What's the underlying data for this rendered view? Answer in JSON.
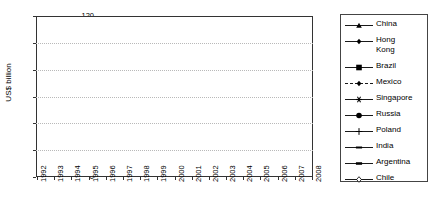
{
  "chart_data": {
    "type": "line",
    "title": "",
    "xlabel": "",
    "ylabel": "US$ billion",
    "ylim": [
      0,
      120
    ],
    "yticks": [
      0,
      20,
      40,
      60,
      80,
      100,
      120
    ],
    "grid": true,
    "legend_position": "right",
    "x": [
      1992,
      1993,
      1994,
      1995,
      1996,
      1997,
      1998,
      1999,
      2000,
      2001,
      2002,
      2003,
      2004,
      2005,
      2006,
      2007,
      2008
    ],
    "categories": [
      "1992",
      "1993",
      "1994",
      "1995",
      "1996",
      "1997",
      "1998",
      "1999",
      "2000",
      "2001",
      "2002",
      "2003",
      "2004",
      "2005",
      "2006",
      "2007",
      "2008"
    ],
    "series": [
      {
        "name": "China",
        "marker": "triangle",
        "line": "solid",
        "values": [
          11,
          27,
          34,
          36,
          40,
          44.5,
          45.5,
          40.5,
          41,
          47,
          53,
          54,
          61,
          73,
          73,
          84,
          108
        ]
      },
      {
        "name": "Hong Kong",
        "marker": "diamond",
        "line": "solid",
        "values": [
          3.9,
          3.7,
          7.8,
          6.2,
          10.5,
          11.4,
          14.8,
          24.6,
          62.5,
          23.8,
          9.7,
          13.6,
          34.3,
          34.6,
          45.7,
          55.9,
          63
        ]
      },
      {
        "name": "Brazil",
        "marker": "square",
        "line": "solid",
        "values": [
          2.1,
          1.3,
          2.2,
          4.4,
          11,
          19,
          28.9,
          28.6,
          32.8,
          22.5,
          16.6,
          10.1,
          18.1,
          15.1,
          18.8,
          34.6,
          45.1
        ]
      },
      {
        "name": "Mexico",
        "marker": "diamond",
        "line": "dashed",
        "values": [
          4.4,
          4.4,
          11,
          9.5,
          9.2,
          12.8,
          12.4,
          13.7,
          17.8,
          27.2,
          19.1,
          14.2,
          22.3,
          21.9,
          19.3,
          27.3,
          22
        ]
      },
      {
        "name": "Singapore",
        "marker": "asterisk",
        "line": "solid",
        "values": [
          2.2,
          4.7,
          8.6,
          8.8,
          9.7,
          13,
          7.3,
          16.6,
          16.5,
          15.1,
          6.4,
          11.9,
          19.8,
          15,
          24.7,
          31.6,
          22.7
        ]
      },
      {
        "name": "Russia",
        "marker": "circle",
        "line": "solid",
        "values": [
          0.7,
          1.2,
          0.6,
          2,
          2.6,
          4.9,
          2.8,
          3.3,
          2.7,
          2.7,
          3.5,
          8,
          15.4,
          12.9,
          29.7,
          55.1,
          70.3
        ]
      },
      {
        "name": "Poland",
        "marker": "plus",
        "line": "solid",
        "values": [
          0.7,
          1.7,
          1.9,
          3.7,
          4.5,
          4.9,
          6.4,
          7.3,
          9.3,
          5.7,
          4.1,
          4.6,
          12.9,
          10.3,
          19.6,
          23.7,
          16.5
        ]
      },
      {
        "name": "India",
        "marker": "dash",
        "line": "solid",
        "values": [
          0.3,
          0.6,
          1,
          2.1,
          2.4,
          3.6,
          2.6,
          2.2,
          3.6,
          5.5,
          5.6,
          4.3,
          5.8,
          7.6,
          20,
          25,
          41.6
        ]
      },
      {
        "name": "Argentina",
        "marker": "bar",
        "line": "solid",
        "values": [
          4.4,
          2.8,
          3.6,
          5.6,
          6.9,
          9.2,
          7.3,
          23.9,
          10.4,
          2.2,
          2.1,
          1.7,
          4.1,
          5.3,
          5.5,
          6.5,
          9.7
        ]
      },
      {
        "name": "Chile",
        "marker": "open-diamond",
        "line": "solid",
        "values": [
          0.9,
          1.0,
          2.6,
          3,
          4.8,
          5.3,
          4.6,
          8.8,
          4.9,
          4.2,
          2.5,
          4.3,
          7.2,
          7,
          7.4,
          13.4,
          17.4
        ]
      }
    ]
  },
  "axis": {
    "y_title": "US$ billion",
    "y_tick_labels": [
      "120",
      "100",
      "80",
      "60",
      "40",
      "20",
      "0"
    ],
    "x_tick_labels": [
      "1992",
      "1993",
      "1994",
      "1995",
      "1996",
      "1997",
      "1998",
      "1999",
      "2000",
      "2001",
      "2002",
      "2003",
      "2004",
      "2005",
      "2006",
      "2007",
      "2008"
    ]
  },
  "legend": {
    "items": [
      {
        "label": "China"
      },
      {
        "label": "Hong\nKong"
      },
      {
        "label": "Brazil"
      },
      {
        "label": "Mexico"
      },
      {
        "label": "Singapore"
      },
      {
        "label": "Russia"
      },
      {
        "label": "Poland"
      },
      {
        "label": "India"
      },
      {
        "label": "Argentina"
      },
      {
        "label": "Chile"
      }
    ]
  },
  "colors": {
    "line": "#000000",
    "grid": "#b9b9b9",
    "frame": "#333333",
    "background": "#ffffff"
  }
}
